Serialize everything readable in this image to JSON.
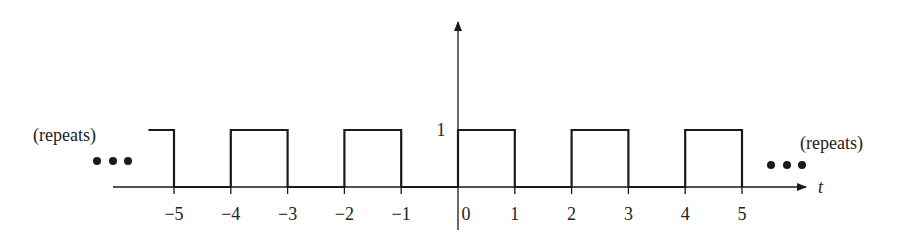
{
  "figure": {
    "type": "square-wave",
    "left_annotation": "(repeats)",
    "right_annotation": "(repeats)",
    "ellipsis": "• • •",
    "axis_label_t": "t",
    "y_tick_label": "1",
    "x_tick_labels": [
      "−5",
      "−4",
      "−3",
      "−2",
      "−1",
      "0",
      "1",
      "2",
      "3",
      "4",
      "5"
    ],
    "colors": {
      "line": "#1a1a1a",
      "text": "#222222",
      "background": "#ffffff"
    }
  },
  "chart_data": {
    "type": "line",
    "title": "",
    "xlabel": "t",
    "ylabel": "",
    "period": 2,
    "amplitude": 1,
    "x": [
      -5.45,
      -5,
      -5,
      -4,
      -4,
      -3,
      -3,
      -2,
      -2,
      -1,
      -1,
      0,
      0,
      1,
      1,
      2,
      2,
      3,
      3,
      4,
      4,
      5,
      5
    ],
    "y": [
      1,
      1,
      0,
      0,
      1,
      1,
      0,
      0,
      1,
      1,
      0,
      0,
      1,
      1,
      0,
      0,
      1,
      1,
      0,
      0,
      1,
      1,
      0
    ],
    "x_ticks": [
      -5,
      -4,
      -3,
      -2,
      -1,
      0,
      1,
      2,
      3,
      4,
      5
    ],
    "y_ticks": [
      1
    ],
    "xlim": [
      -6,
      6
    ],
    "ylim": [
      -0.5,
      3
    ],
    "grid": false,
    "legend": "none",
    "annotations": [
      "(repeats) left",
      "(repeats) right"
    ]
  }
}
